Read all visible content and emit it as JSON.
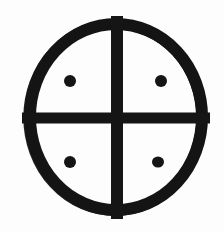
{
  "image": {
    "kind": "line-drawing",
    "subject": "sun-cross-with-dots",
    "description": "Black hand-inked circle divided into four quadrants by a cross, with a single filled dot centered in each quadrant",
    "width": 224,
    "height": 232,
    "background_color": "#fdfdfd",
    "ink_color": "#151515"
  },
  "geometry": {
    "circle": {
      "center_x": 116,
      "center_y": 117,
      "radius_x": 92,
      "radius_y": 99,
      "stroke_width": 12
    },
    "cross": {
      "vertical_bar": {
        "center_x": 117,
        "top_y": 16,
        "bottom_y": 219,
        "width": 12
      },
      "horizontal_bar": {
        "center_y": 118,
        "left_x": 22,
        "right_x": 210,
        "height": 11
      }
    },
    "dots": [
      {
        "label": "dot-top-left",
        "cx": 70,
        "cy": 81,
        "rx": 6,
        "ry": 6
      },
      {
        "label": "dot-top-right",
        "cx": 161,
        "cy": 81,
        "rx": 6,
        "ry": 6
      },
      {
        "label": "dot-bottom-left",
        "cx": 70,
        "cy": 162,
        "rx": 6,
        "ry": 6
      },
      {
        "label": "dot-bottom-right",
        "cx": 158,
        "cy": 162,
        "rx": 6,
        "ry": 5.5
      }
    ],
    "quadrants": [
      {
        "label": "quadrant-top-left"
      },
      {
        "label": "quadrant-top-right"
      },
      {
        "label": "quadrant-bottom-left"
      },
      {
        "label": "quadrant-bottom-right"
      }
    ]
  }
}
